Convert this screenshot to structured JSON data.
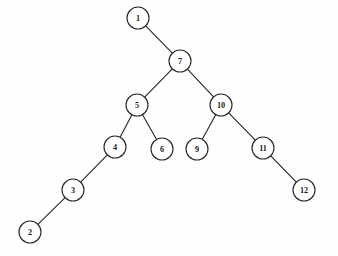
{
  "figure": {
    "kind": "binary-tree-diagram",
    "background_color": "#fefefe",
    "stroke_color": "#2b2b2b",
    "node_fill_color": "#ffffff",
    "label_color": "#1a1a1a",
    "node_radius": 11,
    "width": 338,
    "height": 256
  },
  "graph": {
    "nodes": [
      {
        "id": "n1",
        "label": "1",
        "x": 138,
        "y": 18
      },
      {
        "id": "n7",
        "label": "7",
        "x": 180,
        "y": 61
      },
      {
        "id": "n5",
        "label": "5",
        "x": 137,
        "y": 105
      },
      {
        "id": "n10",
        "label": "10",
        "x": 221,
        "y": 105
      },
      {
        "id": "n4",
        "label": "4",
        "x": 115,
        "y": 147
      },
      {
        "id": "n6",
        "label": "6",
        "x": 162,
        "y": 149
      },
      {
        "id": "n9",
        "label": "9",
        "x": 197,
        "y": 149
      },
      {
        "id": "n11",
        "label": "11",
        "x": 263,
        "y": 148
      },
      {
        "id": "n3",
        "label": "3",
        "x": 73,
        "y": 190
      },
      {
        "id": "n12",
        "label": "12",
        "x": 304,
        "y": 190
      },
      {
        "id": "n2",
        "label": "2",
        "x": 30,
        "y": 232
      }
    ],
    "edges": [
      {
        "from": "n1",
        "to": "n7"
      },
      {
        "from": "n7",
        "to": "n5"
      },
      {
        "from": "n7",
        "to": "n10"
      },
      {
        "from": "n5",
        "to": "n4"
      },
      {
        "from": "n5",
        "to": "n6"
      },
      {
        "from": "n4",
        "to": "n3"
      },
      {
        "from": "n3",
        "to": "n2"
      },
      {
        "from": "n10",
        "to": "n9"
      },
      {
        "from": "n10",
        "to": "n11"
      },
      {
        "from": "n11",
        "to": "n12"
      }
    ]
  }
}
